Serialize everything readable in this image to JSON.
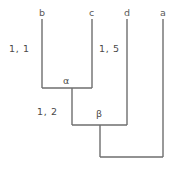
{
  "diagram": {
    "type": "phylogenetic-tree",
    "background_color": "#ffffff",
    "line_color": "#6e6e6e",
    "text_color": "#4a4a4a",
    "width": 173,
    "height": 170,
    "leaves": [
      {
        "id": "leaf-b",
        "label": "b",
        "x": 42,
        "label_x": 39,
        "label_y": 8,
        "top": 19,
        "bottom": 88
      },
      {
        "id": "leaf-c",
        "label": "c",
        "x": 92,
        "label_x": 89,
        "label_y": 8,
        "top": 19,
        "bottom": 88
      },
      {
        "id": "leaf-d",
        "label": "d",
        "x": 127,
        "label_x": 124,
        "label_y": 8,
        "top": 19,
        "bottom": 125
      },
      {
        "id": "leaf-a",
        "label": "a",
        "x": 163,
        "label_x": 160,
        "label_y": 8,
        "top": 19,
        "bottom": 157
      }
    ],
    "internal_nodes": [
      {
        "id": "node-alpha",
        "label": "α",
        "label_x": 63,
        "label_y": 76,
        "bar_y": 88,
        "bar_x1": 42,
        "bar_x2": 92,
        "stem_x": 72,
        "stem_bottom": 125,
        "children": [
          "b",
          "c"
        ]
      },
      {
        "id": "node-beta",
        "label": "β",
        "label_x": 96,
        "label_y": 109,
        "bar_y": 125,
        "bar_x1": 72,
        "bar_x2": 127,
        "stem_x": 100,
        "stem_bottom": 157,
        "children": [
          "alpha",
          "d"
        ]
      },
      {
        "id": "node-root",
        "label": "",
        "bar_y": 157,
        "bar_x1": 100,
        "bar_x2": 163,
        "stem_x": null,
        "stem_bottom": null,
        "children": [
          "beta",
          "a"
        ]
      }
    ],
    "branch_labels": [
      {
        "id": "branch-label-b",
        "text": "1, 1",
        "x": 9,
        "y": 44,
        "describes": "branch leading to b"
      },
      {
        "id": "branch-label-d",
        "text": "1, 5",
        "x": 99,
        "y": 44,
        "describes": "branch leading to d"
      },
      {
        "id": "branch-label-alpha",
        "text": "1, 2",
        "x": 37,
        "y": 107,
        "describes": "branch leading to alpha"
      }
    ]
  }
}
